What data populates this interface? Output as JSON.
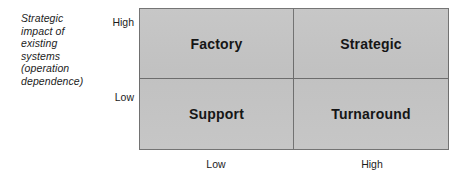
{
  "figure": {
    "type": "matrix",
    "background_color": "#ffffff",
    "cell_fill_color": "#c4c4c4",
    "border_color": "#6e6e6e",
    "text_color": "#111111"
  },
  "y_axis": {
    "caption_lines": [
      "Strategic",
      "impact of",
      "existing",
      "systems",
      "(operation",
      "dependence)"
    ],
    "high_label": "High",
    "low_label": "Low"
  },
  "x_axis": {
    "low_label": "Low",
    "high_label": "High"
  },
  "quadrants": {
    "top_left": "Factory",
    "top_right": "Strategic",
    "bottom_left": "Support",
    "bottom_right": "Turnaround"
  },
  "chart_data": {
    "type": "heatmap",
    "title": "",
    "xlabel": "",
    "ylabel": "Strategic impact of existing systems (operation dependence)",
    "x_tick_labels": [
      "Low",
      "High"
    ],
    "y_tick_labels": [
      "Low",
      "High"
    ],
    "cells": [
      {
        "row": "High",
        "col": "Low",
        "label": "Factory"
      },
      {
        "row": "High",
        "col": "High",
        "label": "Strategic"
      },
      {
        "row": "Low",
        "col": "Low",
        "label": "Support"
      },
      {
        "row": "Low",
        "col": "High",
        "label": "Turnaround"
      }
    ],
    "grid": true,
    "legend": "none"
  }
}
